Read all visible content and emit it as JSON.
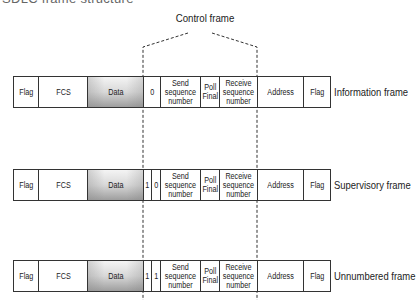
{
  "title": "SDLC frame structure",
  "control_frame_label": "Control frame",
  "colors": {
    "border": "#333333",
    "data_gradient_top": "#f4f4f4",
    "data_gradient_bottom": "#9e9e9e"
  },
  "rows": [
    {
      "label": "Information frame",
      "cells": {
        "flag_start": "Flag",
        "fcs": "FCS",
        "data": "Data",
        "bit_a": "0",
        "send": "Send\nsequence\nnumber",
        "poll": "Poll\nFinal",
        "receive": "Receive\nsequence\nnumber",
        "address": "Address",
        "flag_end": "Flag"
      }
    },
    {
      "label": "Supervisory frame",
      "cells": {
        "flag_start": "Flag",
        "fcs": "FCS",
        "data": "Data",
        "bit_a": "1",
        "bit_b": "0",
        "send": "Send\nsequence\nnumber",
        "poll": "Poll\nFinal",
        "receive": "Receive\nsequence\nnumber",
        "address": "Address",
        "flag_end": "Flag"
      }
    },
    {
      "label": "Unnumbered frame",
      "cells": {
        "flag_start": "Flag",
        "fcs": "FCS",
        "data": "Data",
        "bit_a": "1",
        "bit_b": "1",
        "send": "Send\nsequence\nnumber",
        "poll": "Poll\nFinal",
        "receive": "Receive\nsequence\nnumber",
        "address": "Address",
        "flag_end": "Flag"
      }
    }
  ]
}
